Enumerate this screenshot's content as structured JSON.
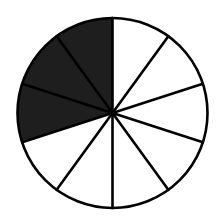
{
  "diagram": {
    "type": "fraction-circle",
    "total_sectors": 10,
    "shaded_sectors": 3,
    "shaded_sector_indices": [
      7,
      8,
      9
    ],
    "start_angle_deg": 0,
    "direction": "clockwise-from-top",
    "center": [
      112.5,
      113
    ],
    "radius": 95,
    "colors": {
      "background": "#ffffff",
      "shaded_fill": "#1e1e1e",
      "unshaded_fill": "#ffffff",
      "stroke": "#000000"
    },
    "stroke_width": 2.6
  }
}
